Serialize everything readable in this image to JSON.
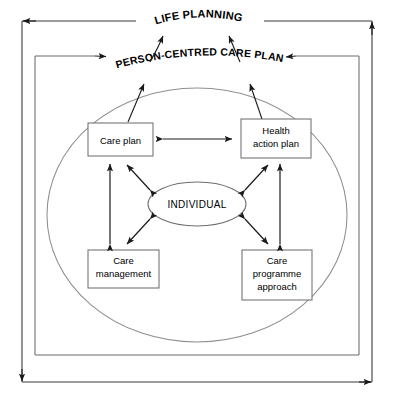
{
  "diagram": {
    "type": "concentric-relationship-diagram",
    "outer_label": "LIFE PLANNING",
    "middle_label": "PERSON-CENTRED CARE PLAN",
    "centre_label": "INDIVIDUAL",
    "boxes": [
      {
        "id": "care-plan",
        "label": "Care plan",
        "label_lines": [
          "Care plan"
        ]
      },
      {
        "id": "health-action-plan",
        "label": "Health action plan",
        "label_lines": [
          "Health",
          "action plan"
        ]
      },
      {
        "id": "care-management",
        "label": "Care management",
        "label_lines": [
          "Care",
          "management"
        ]
      },
      {
        "id": "care-programme-approach",
        "label": "Care programme approach",
        "label_lines": [
          "Care",
          "programme",
          "approach"
        ]
      }
    ],
    "colors": {
      "stroke": "#2b2b2b",
      "box_stroke": "#6e6e6e",
      "ellipse_stroke": "#8a8a8a",
      "frame_stroke": "#3a3a3a",
      "background": "#ffffff",
      "text": "#000000"
    }
  }
}
